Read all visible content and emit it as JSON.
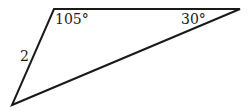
{
  "diagram": {
    "type": "triangle",
    "vertices": {
      "top_left": [
        54,
        9
      ],
      "top_right": [
        240,
        9
      ],
      "bottom_left": [
        12,
        105
      ]
    },
    "stroke_color": "#1a1a1a",
    "labels": {
      "angle_top_left": "105°",
      "angle_top_right": "30°",
      "side_left": "2"
    }
  }
}
